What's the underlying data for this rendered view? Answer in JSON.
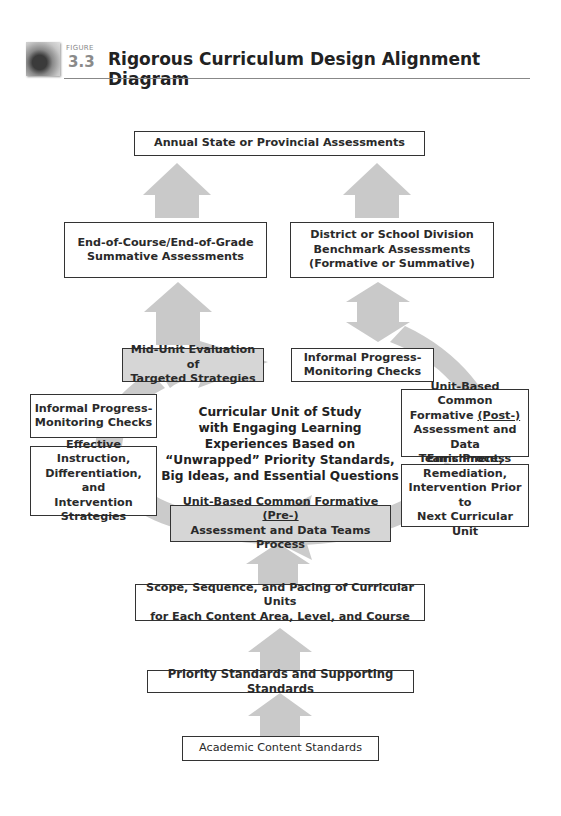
{
  "figure": {
    "label": "FIGURE",
    "number": "3.3",
    "title": "Rigorous Curriculum Design Alignment Diagram"
  },
  "boxes": {
    "annual": "Annual State or Provincial Assessments",
    "end_of_course": {
      "line1": "End-of-Course/End-of-Grade",
      "line2": "Summative Assessments"
    },
    "district": {
      "line1": "District or School Division",
      "line2": "Benchmark Assessments",
      "line3": "(Formative or Summative)"
    },
    "mid_unit": {
      "line1": "Mid-Unit Evaluation of",
      "line2": "Targeted Strategies"
    },
    "informal_top": {
      "line1": "Informal Progress-",
      "line2": "Monitoring Checks"
    },
    "informal_left": {
      "line1": "Informal Progress-",
      "line2": "Monitoring Checks"
    },
    "effective": {
      "line1": "Effective Instruction,",
      "line2": "Differentiation, and",
      "line3": "Intervention",
      "line4": "Strategies"
    },
    "post": {
      "line1": "Unit-Based Common",
      "line2_pre": "Formative ",
      "line2_em": "(Post-)",
      "line3": "Assessment and Data",
      "line4": "Teams Process"
    },
    "enrichment": {
      "line1": "Enrichment,",
      "line2": "Remediation,",
      "line3": "Intervention Prior to",
      "line4": "Next Curricular Unit"
    },
    "pre": {
      "line1_pre": "Unit-Based Common Formative ",
      "line1_em": "(Pre-)",
      "line2": "Assessment and Data Teams Process"
    },
    "scope": {
      "line1": "Scope, Sequence, and Pacing of Curricular Units",
      "line2": "for Each Content Area, Level, and Course"
    },
    "priority": {
      "bold": "Priority Standards",
      "rest": " and Supporting Standards"
    },
    "academic": "Academic Content Standards"
  },
  "center": {
    "line1": "Curricular Unit of Study",
    "line2": "with Engaging Learning",
    "line3": "Experiences Based on",
    "line4": "“Unwrapped” Priority Standards,",
    "line5": "Big Ideas, and Essential Questions"
  },
  "colors": {
    "arrow": "#c9c9c9",
    "box_border": "#333333",
    "shaded_box": "#d6d6d6",
    "title": "#222222",
    "figure_number": "#8a8a8a"
  }
}
